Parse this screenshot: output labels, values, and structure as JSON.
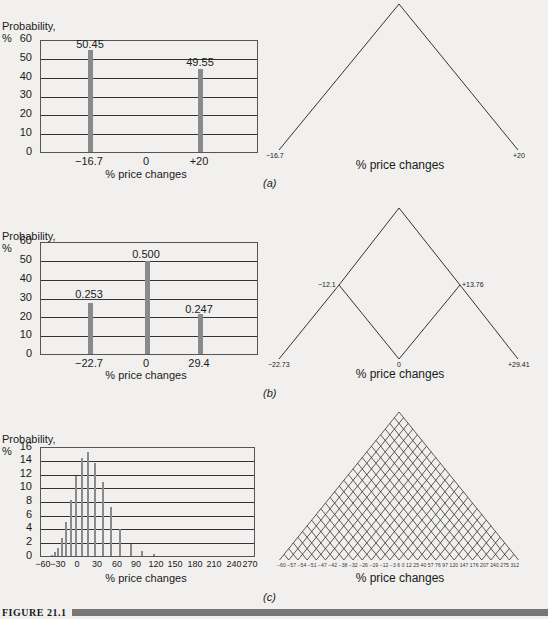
{
  "figure": {
    "caption": "FIGURE 21.1"
  },
  "chart_data": [
    {
      "panel": "(a)",
      "type": "bar",
      "title": "",
      "ylabel": "Probability, %",
      "xlabel": "% price changes",
      "ylim": [
        0,
        60
      ],
      "yticks": [
        0,
        10,
        20,
        30,
        40,
        50,
        60
      ],
      "xticks": [
        "-16.7",
        "0",
        "+20"
      ],
      "grid": true,
      "categories": [
        "-16.7",
        "+20"
      ],
      "values": [
        50.45,
        49.55
      ],
      "data_labels": [
        "50.45",
        "49.55"
      ]
    },
    {
      "panel": "(a)",
      "type": "tree",
      "xlabel": "% price changes",
      "nodes": [
        "-16.7",
        "+20"
      ]
    },
    {
      "panel": "(b)",
      "type": "bar",
      "ylabel": "Probability, %",
      "xlabel": "% price changes",
      "ylim": [
        0,
        60
      ],
      "yticks": [
        0,
        10,
        20,
        30,
        40,
        50,
        60
      ],
      "xticks": [
        "-22.7",
        "0",
        "29.4"
      ],
      "grid": true,
      "categories": [
        "-22.7",
        "0",
        "29.4"
      ],
      "values": [
        25.3,
        50.0,
        24.7
      ],
      "data_labels": [
        "0.253",
        "0.500",
        "0.247"
      ]
    },
    {
      "panel": "(b)",
      "type": "tree",
      "xlabel": "% price changes",
      "intermediate_nodes": [
        "-12.1",
        "+13.76"
      ],
      "terminal_nodes": [
        "-22.73",
        "0",
        "+29.41"
      ]
    },
    {
      "panel": "(c)",
      "type": "bar",
      "ylabel": "Probability, %",
      "xlabel": "% price changes",
      "ylim": [
        0,
        16
      ],
      "yticks": [
        0,
        2,
        4,
        6,
        8,
        10,
        12,
        14,
        16
      ],
      "xticks": [
        "-60",
        "-30",
        "0",
        "30",
        "60",
        "90",
        "120",
        "150",
        "180",
        "210",
        "240",
        "270"
      ],
      "xlim": [
        -60,
        280
      ],
      "grid": true,
      "x": [
        -47,
        -42,
        -38,
        -32,
        -26,
        -19,
        -12,
        -3,
        6,
        12,
        25,
        40,
        57,
        76,
        97,
        120,
        147
      ],
      "values": [
        0.2,
        0.5,
        1.1,
        2.6,
        5.0,
        8.3,
        11.9,
        14.6,
        15.5,
        13.9,
        11.0,
        7.4,
        4.1,
        1.9,
        0.8,
        0.3,
        0.1
      ]
    },
    {
      "panel": "(c)",
      "type": "tree",
      "xlabel": "% price changes",
      "terminal_nodes": [
        "-60",
        "-57",
        "-54",
        "-51",
        "-47",
        "-42",
        "-38",
        "-32",
        "-26",
        "-19",
        "-12",
        "-3",
        "6",
        "0",
        "12",
        "25",
        "40",
        "57",
        "76",
        "97",
        "120",
        "147",
        "176",
        "207",
        "240",
        "275",
        "312"
      ]
    }
  ],
  "labels": {
    "prob": "Probability, %",
    "xlabel": "% price changes",
    "a": "(a)",
    "b": "(b)",
    "c": "(c)",
    "a_bar1": "50.45",
    "a_bar2": "49.55",
    "a_x1": "−16.7",
    "a_x2": "0",
    "a_x3": "+20",
    "b_bar1": "0.253",
    "b_bar2": "0.500",
    "b_bar3": "0.247",
    "b_x1": "−22.7",
    "b_x2": "0",
    "b_x3": "29.4",
    "ta_l": "−16.7",
    "ta_r": "+20",
    "tb_m1": "−12.1",
    "tb_m2": "+13.76",
    "tb_l": "−22.73",
    "tb_c": "0",
    "tb_r": "+29.41",
    "tc_ticks": "−60 −57 −54 −51 −47 −42 −38 −32 −26 −19 −12 −3  6  0  12  25  40  57  76  97  120 147 176 207 240 275 312"
  },
  "ticks": {
    "ab": [
      "60",
      "50",
      "40",
      "30",
      "20",
      "10",
      "0"
    ],
    "c": [
      "16",
      "14",
      "12",
      "10",
      "8",
      "6",
      "4",
      "2",
      "0"
    ],
    "cx": [
      "−60",
      "−30",
      "0",
      "30",
      "60",
      "90",
      "120",
      "150",
      "180",
      "210",
      "240",
      "270"
    ]
  }
}
